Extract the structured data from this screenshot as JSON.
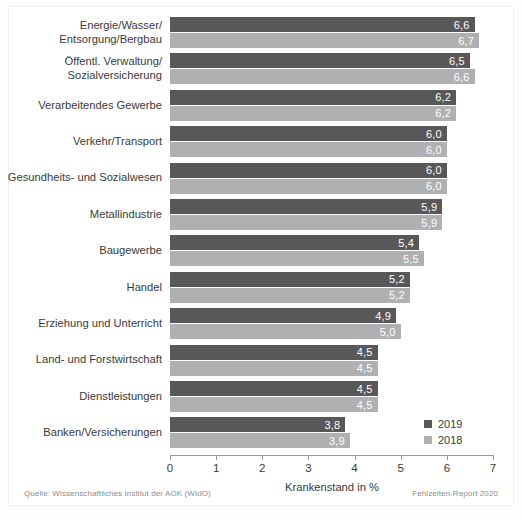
{
  "chart_data": {
    "type": "bar",
    "orientation": "horizontal",
    "title": "",
    "xlabel": "Krankenstand in %",
    "ylabel": "",
    "xlim": [
      0,
      7
    ],
    "xticks": [
      "0",
      "1",
      "2",
      "3",
      "4",
      "5",
      "6",
      "7"
    ],
    "grid": false,
    "legend_position": "bottom-right",
    "categories": [
      "Energie/Wasser/\nEntsorgung/Bergbau",
      "Öffentl. Verwaltung/\nSozialversicherung",
      "Verarbeitendes Gewerbe",
      "Verkehr/Transport",
      "Gesundheits- und Sozialwesen",
      "Metallindustrie",
      "Baugewerbe",
      "Handel",
      "Erziehung und Unterricht",
      "Land- und Forstwirtschaft",
      "Dienstleistungen",
      "Banken/Versicherungen"
    ],
    "series": [
      {
        "name": "2019",
        "color": "#58585a",
        "values": [
          6.6,
          6.5,
          6.2,
          6.0,
          6.0,
          5.9,
          5.4,
          5.2,
          4.9,
          4.5,
          4.5,
          3.8
        ],
        "labels": [
          "6,6",
          "6,5",
          "6,2",
          "6,0",
          "6,0",
          "5,9",
          "5,4",
          "5,2",
          "4,9",
          "4,5",
          "4,5",
          "3,8"
        ]
      },
      {
        "name": "2018",
        "color": "#b0b0b2",
        "values": [
          6.7,
          6.6,
          6.2,
          6.0,
          6.0,
          5.9,
          5.5,
          5.2,
          5.0,
          4.5,
          4.5,
          3.9
        ],
        "labels": [
          "6,7",
          "6,6",
          "6,2",
          "6,0",
          "6,0",
          "5,9",
          "5,5",
          "5,2",
          "5,0",
          "4,5",
          "4,5",
          "3,9"
        ]
      }
    ]
  },
  "legend": [
    {
      "label": "2019",
      "series": "2019"
    },
    {
      "label": "2018",
      "series": "2018"
    }
  ],
  "footer": {
    "source": "Quelle: Wissenschaftliches Institut der AOK (WIdO)",
    "report": "Fehlzeiten-Report 2020"
  }
}
